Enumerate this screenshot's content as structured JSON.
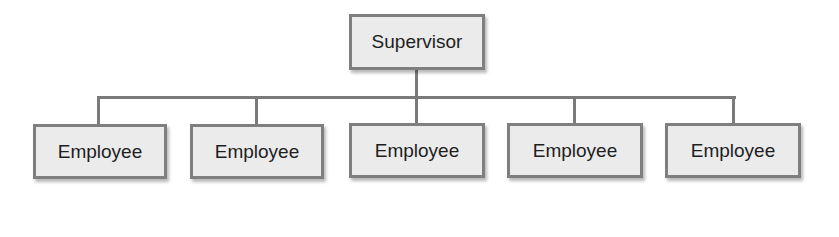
{
  "diagram": {
    "type": "org-chart",
    "root": {
      "label": "Supervisor"
    },
    "children": [
      {
        "label": "Employee"
      },
      {
        "label": "Employee"
      },
      {
        "label": "Employee"
      },
      {
        "label": "Employee"
      },
      {
        "label": "Employee"
      }
    ],
    "colors": {
      "box_fill": "#ebebeb",
      "box_border": "#7f7f7f",
      "connector": "#7a7a7a",
      "text": "#1e1e1e"
    }
  }
}
